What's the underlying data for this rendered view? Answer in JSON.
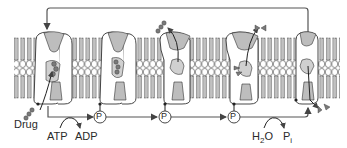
{
  "diagram": {
    "colors": {
      "stroke": "#333333",
      "protein_fill": "#ffffff",
      "domain_fill": "#bdbdbd",
      "drug_fill": "#7a7a7a",
      "arrow": "#555555",
      "lipid_fill": "#ffffff"
    },
    "labels": {
      "drug": "Drug",
      "atp": "ATP",
      "adp": "ADP",
      "h2o_h": "H",
      "h2o_sub": "2",
      "h2o_o": "O",
      "pi_p": "P",
      "pi_sub": "i",
      "phosphate": "P"
    },
    "states": [
      {
        "id": 1,
        "description": "drug binding from cytoplasm"
      },
      {
        "id": 2,
        "description": "phosphorylated, drug bound"
      },
      {
        "id": 3,
        "description": "conformation change, drug released outward"
      },
      {
        "id": 4,
        "description": "phosphorylated, second substrate bound"
      },
      {
        "id": 5,
        "description": "dephosphorylated, substrate released"
      }
    ],
    "phosphate_markers": [
      {
        "x": 100,
        "y": 117
      },
      {
        "x": 165,
        "y": 117
      },
      {
        "x": 234,
        "y": 117
      }
    ]
  }
}
